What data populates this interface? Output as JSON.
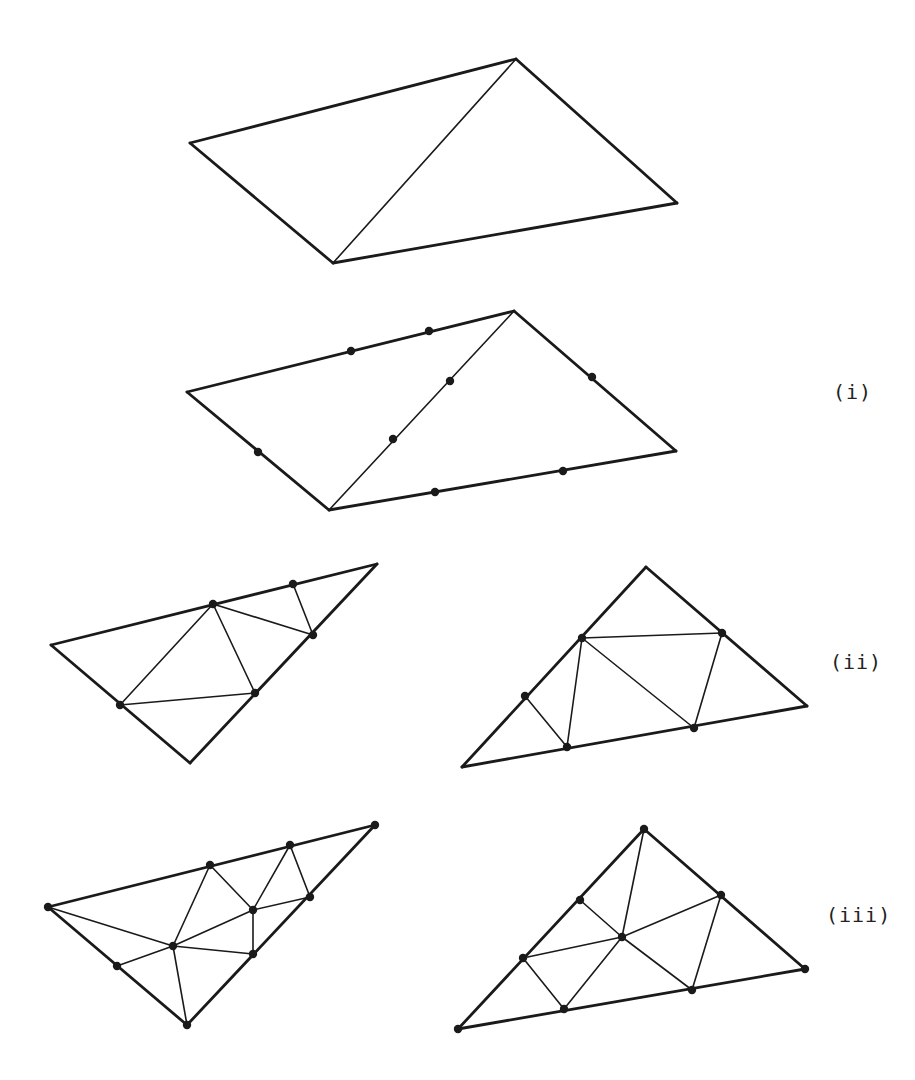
{
  "figure": {
    "stroke_color": "#1a1a1a",
    "node_color": "#1a1a1a",
    "labels": [
      {
        "text": "(i)",
        "x": 833,
        "y": 380
      },
      {
        "text": "(ii)",
        "x": 830,
        "y": 650
      },
      {
        "text": "(iii)",
        "x": 826,
        "y": 903
      }
    ],
    "panels": [
      {
        "name": "base-mesh",
        "thick": [
          [
            190,
            143,
            516,
            59
          ],
          [
            516,
            59,
            677,
            203
          ],
          [
            677,
            203,
            333,
            263
          ],
          [
            333,
            263,
            190,
            143
          ]
        ],
        "thin": [
          [
            333,
            263,
            516,
            59
          ]
        ],
        "nodes": []
      },
      {
        "name": "stage-i",
        "thick": [
          [
            187,
            392,
            514,
            311
          ],
          [
            514,
            311,
            676,
            451
          ],
          [
            676,
            451,
            329,
            510
          ],
          [
            329,
            510,
            187,
            392
          ]
        ],
        "thin": [
          [
            329,
            510,
            514,
            311
          ]
        ],
        "nodes": [
          [
            351,
            351
          ],
          [
            429,
            331
          ],
          [
            450,
            381
          ],
          [
            393,
            439
          ],
          [
            258,
            452
          ],
          [
            435,
            492
          ],
          [
            563,
            471
          ],
          [
            592,
            377
          ]
        ]
      },
      {
        "name": "stage-ii-left",
        "thick": [
          [
            51,
            645,
            377,
            564
          ],
          [
            377,
            564,
            190,
            763
          ],
          [
            190,
            763,
            51,
            645
          ]
        ],
        "thin": [
          [
            213,
            604,
            120,
            705
          ],
          [
            213,
            604,
            255,
            693
          ],
          [
            213,
            604,
            313,
            635
          ],
          [
            293,
            584,
            313,
            635
          ],
          [
            120,
            705,
            255,
            693
          ]
        ],
        "nodes": [
          [
            213,
            604
          ],
          [
            293,
            584
          ],
          [
            313,
            635
          ],
          [
            255,
            693
          ],
          [
            120,
            705
          ]
        ]
      },
      {
        "name": "stage-ii-right",
        "thick": [
          [
            646,
            567,
            807,
            706
          ],
          [
            807,
            706,
            462,
            767
          ],
          [
            462,
            767,
            646,
            567
          ]
        ],
        "thin": [
          [
            582,
            638,
            722,
            633
          ],
          [
            582,
            638,
            567,
            747
          ],
          [
            582,
            638,
            694,
            728
          ],
          [
            722,
            633,
            694,
            728
          ],
          [
            525,
            696,
            567,
            747
          ]
        ],
        "nodes": [
          [
            582,
            638
          ],
          [
            722,
            633
          ],
          [
            525,
            696
          ],
          [
            567,
            747
          ],
          [
            694,
            728
          ]
        ]
      },
      {
        "name": "stage-iii-left",
        "thick": [
          [
            48,
            907,
            375,
            825
          ],
          [
            375,
            825,
            187,
            1025
          ],
          [
            187,
            1025,
            48,
            907
          ]
        ],
        "thin": [
          [
            48,
            907,
            173,
            946
          ],
          [
            210,
            865,
            173,
            946
          ],
          [
            210,
            865,
            253,
            910
          ],
          [
            290,
            845,
            253,
            910
          ],
          [
            290,
            845,
            310,
            897
          ],
          [
            253,
            910,
            310,
            897
          ],
          [
            173,
            946,
            253,
            910
          ],
          [
            173,
            946,
            253,
            954
          ],
          [
            253,
            910,
            253,
            954
          ],
          [
            173,
            946,
            187,
            1025
          ],
          [
            117,
            966,
            173,
            946
          ]
        ],
        "nodes": [
          [
            48,
            907
          ],
          [
            375,
            825
          ],
          [
            187,
            1025
          ],
          [
            210,
            865
          ],
          [
            290,
            845
          ],
          [
            310,
            897
          ],
          [
            253,
            910
          ],
          [
            173,
            946
          ],
          [
            253,
            954
          ],
          [
            117,
            966
          ]
        ]
      },
      {
        "name": "stage-iii-right",
        "thick": [
          [
            644,
            829,
            805,
            969
          ],
          [
            805,
            969,
            458,
            1029
          ],
          [
            458,
            1029,
            644,
            829
          ]
        ],
        "thin": [
          [
            644,
            829,
            622,
            937
          ],
          [
            580,
            900,
            622,
            937
          ],
          [
            622,
            937,
            721,
            895
          ],
          [
            523,
            958,
            622,
            937
          ],
          [
            622,
            937,
            564,
            1009
          ],
          [
            622,
            937,
            692,
            990
          ],
          [
            721,
            895,
            692,
            990
          ],
          [
            523,
            958,
            564,
            1009
          ]
        ],
        "nodes": [
          [
            644,
            829
          ],
          [
            458,
            1029
          ],
          [
            805,
            969
          ],
          [
            580,
            900
          ],
          [
            721,
            895
          ],
          [
            622,
            937
          ],
          [
            523,
            958
          ],
          [
            564,
            1009
          ],
          [
            692,
            990
          ]
        ]
      }
    ]
  }
}
